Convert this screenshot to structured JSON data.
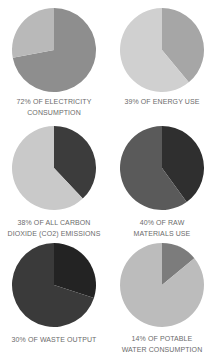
{
  "chart_data": [
    {
      "type": "pie",
      "title": "72% OF ELECTRICITY CONSUMPTION",
      "title_lines": [
        "72% OF ELECTRICITY",
        "CONSUMPTION"
      ],
      "values": [
        72,
        28
      ],
      "labels": [
        "Electricity consumption share",
        "Remainder"
      ],
      "colors": [
        "#8e8e8e",
        "#b9b9b9"
      ]
    },
    {
      "type": "pie",
      "title": "39% OF ENERGY USE",
      "title_lines": [
        "39% OF ENERGY USE"
      ],
      "values": [
        39,
        61
      ],
      "labels": [
        "Energy use share",
        "Remainder"
      ],
      "colors": [
        "#a6a6a6",
        "#d0d0d0"
      ]
    },
    {
      "type": "pie",
      "title": "38% OF ALL CARBON DIOXIDE (CO2) EMISSIONS",
      "title_lines": [
        "38% OF ALL CARBON",
        "DIOXIDE (CO2) EMISSIONS"
      ],
      "values": [
        38,
        62
      ],
      "labels": [
        "CO2 emissions share",
        "Remainder"
      ],
      "colors": [
        "#3c3c3c",
        "#c9c9c9"
      ]
    },
    {
      "type": "pie",
      "title": "40% OF RAW MATERIALS USE",
      "title_lines": [
        "40% OF RAW",
        "MATERIALS USE"
      ],
      "values": [
        40,
        60
      ],
      "labels": [
        "Raw materials use share",
        "Remainder"
      ],
      "colors": [
        "#2f2f2f",
        "#5a5a5a"
      ]
    },
    {
      "type": "pie",
      "title": "30% OF WASTE OUTPUT",
      "title_lines": [
        "30% OF WASTE OUTPUT"
      ],
      "values": [
        30,
        70
      ],
      "labels": [
        "Waste output share",
        "Remainder"
      ],
      "colors": [
        "#232323",
        "#3a3a3a"
      ]
    },
    {
      "type": "pie",
      "title": "14% OF POTABLE WATER CONSUMPTION",
      "title_lines": [
        "14% OF POTABLE",
        "WATER CONSUMPTION"
      ],
      "values": [
        14,
        86
      ],
      "labels": [
        "Potable water consumption share",
        "Remainder"
      ],
      "colors": [
        "#7c7c7c",
        "#bcbcbc"
      ]
    }
  ],
  "labels": {
    "c0": {
      "l1": "72% OF ELECTRICITY",
      "l2": "CONSUMPTION"
    },
    "c1": {
      "l1": "39% OF ENERGY USE",
      "l2": ""
    },
    "c2": {
      "l1": "38% OF ALL CARBON",
      "l2": "DIOXIDE (CO2) EMISSIONS"
    },
    "c3": {
      "l1": "40% OF RAW",
      "l2": "MATERIALS USE"
    },
    "c4": {
      "l1": "30% OF WASTE OUTPUT",
      "l2": ""
    },
    "c5": {
      "l1": "14% OF POTABLE",
      "l2": "WATER CONSUMPTION"
    }
  }
}
